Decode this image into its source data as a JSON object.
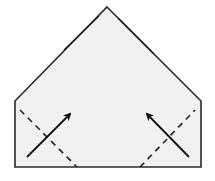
{
  "diagram": {
    "type": "origami-fold-step",
    "colors": {
      "paper": "#f1f1f1",
      "outline": "#2a2a2a",
      "fold_line": "#222222",
      "arrow": "#111111",
      "background": "#ffffff"
    },
    "shape": {
      "points": [
        [
          107,
          7
        ],
        [
          201,
          101
        ],
        [
          201,
          167
        ],
        [
          15,
          167
        ],
        [
          15,
          101
        ]
      ]
    },
    "fold_lines": [
      {
        "name": "left-valley-fold",
        "from": [
          20,
          110
        ],
        "to": [
          77,
          167
        ],
        "style": "dashed"
      },
      {
        "name": "right-valley-fold",
        "from": [
          140,
          167
        ],
        "to": [
          195,
          110
        ],
        "style": "dashed"
      }
    ],
    "arrows": [
      {
        "name": "left-fold-arrow",
        "from": [
          27,
          157
        ],
        "to": [
          71,
          113
        ]
      },
      {
        "name": "right-fold-arrow",
        "from": [
          189,
          157
        ],
        "to": [
          146,
          113
        ]
      }
    ]
  }
}
